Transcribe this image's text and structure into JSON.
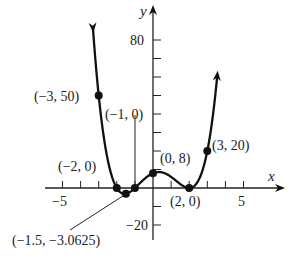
{
  "chart_data": {
    "type": "line",
    "title": "",
    "xlabel": "x",
    "ylabel": "y",
    "function": "f(x) = (x + 2)(x + 1)(x - 2)^2",
    "xlim": [
      -6,
      7
    ],
    "ylim": [
      -25,
      90
    ],
    "x_ticks": [
      -5,
      -4,
      -3,
      -2,
      -1,
      1,
      2,
      3,
      4,
      5
    ],
    "x_tick_labels": [
      {
        "value": -5,
        "label": "−5"
      },
      {
        "value": 5,
        "label": "5"
      }
    ],
    "y_ticks": [
      -20,
      -10,
      10,
      20,
      30,
      40,
      50,
      60,
      70,
      80
    ],
    "y_tick_labels": [
      {
        "value": 80,
        "label": "80"
      },
      {
        "value": -20,
        "label": "−20"
      }
    ],
    "grid": false,
    "labeled_points": [
      {
        "x": -3,
        "y": 50,
        "label": "(−3, 50)"
      },
      {
        "x": -2,
        "y": 0,
        "label": "(−2, 0)"
      },
      {
        "x": -1.5,
        "y": -3.0625,
        "label": "(−1.5, −3.0625)"
      },
      {
        "x": -1,
        "y": 0,
        "label": "(−1, 0)"
      },
      {
        "x": 0,
        "y": 8,
        "label": "(0, 8)"
      },
      {
        "x": 2,
        "y": 0,
        "label": "(2, 0)"
      },
      {
        "x": 3,
        "y": 20,
        "label": "(3, 20)"
      }
    ]
  },
  "axes": {
    "x_label": "x",
    "y_label": "y",
    "x_tick_neg5": "−5",
    "x_tick_5": "5",
    "y_tick_80": "80",
    "y_tick_neg20": "−20"
  },
  "points": {
    "p_m3": "(−3, 50)",
    "p_m2": "(−2, 0)",
    "p_m15": "(−1.5, −3.0625)",
    "p_m1": "(−1, 0)",
    "p_0": "(0, 8)",
    "p_2": "(2, 0)",
    "p_3": "(3, 20)"
  }
}
